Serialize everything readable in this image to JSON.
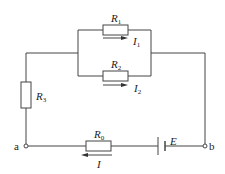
{
  "diagram": {
    "type": "circuit",
    "components": {
      "R1": {
        "label": "R",
        "sub": "1"
      },
      "R2": {
        "label": "R",
        "sub": "2"
      },
      "R3": {
        "label": "R",
        "sub": "3"
      },
      "R0": {
        "label": "R",
        "sub": "0"
      },
      "E": {
        "label": "E"
      }
    },
    "currents": {
      "I1": {
        "label": "I",
        "sub": "1",
        "direction": "right"
      },
      "I2": {
        "label": "I",
        "sub": "2",
        "direction": "right"
      },
      "I": {
        "label": "I",
        "direction": "left"
      }
    },
    "nodes": {
      "a": "a",
      "b": "b"
    },
    "colors": {
      "wire": "#444444",
      "text": "#222222",
      "background": "#ffffff"
    }
  }
}
